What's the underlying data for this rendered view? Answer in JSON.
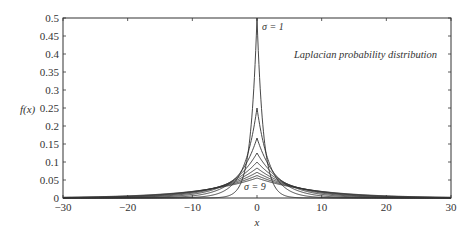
{
  "chart_data": {
    "type": "line",
    "title": "",
    "annotation_title": "Laplacian probability distribution",
    "xlabel": "x",
    "ylabel": "f(x)",
    "xlim": [
      -30,
      30
    ],
    "ylim": [
      0,
      0.5
    ],
    "xticks": [
      -30,
      -20,
      -10,
      0,
      10,
      20,
      30
    ],
    "yticks": [
      0,
      0.05,
      0.1,
      0.15,
      0.2,
      0.25,
      0.3,
      0.35,
      0.4,
      0.45,
      0.5
    ],
    "xtick_labels": [
      "−30",
      "−20",
      "−10",
      "0",
      "10",
      "20",
      "30"
    ],
    "ytick_labels": [
      "0",
      "0.05",
      "0.1",
      "0.15",
      "0.2",
      "0.25",
      "0.3",
      "0.35",
      "0.4",
      "0.45",
      "0.5"
    ],
    "grid": false,
    "legend": "none",
    "formula": "f(x) = (1/(2σ)) exp(-|x|/σ)",
    "series": [
      {
        "name": "σ = 1",
        "sigma": 1,
        "peak": 0.5
      },
      {
        "name": "σ = 2",
        "sigma": 2,
        "peak": 0.25
      },
      {
        "name": "σ = 3",
        "sigma": 3,
        "peak": 0.1667
      },
      {
        "name": "σ = 4",
        "sigma": 4,
        "peak": 0.125
      },
      {
        "name": "σ = 5",
        "sigma": 5,
        "peak": 0.1
      },
      {
        "name": "σ = 6",
        "sigma": 6,
        "peak": 0.0833
      },
      {
        "name": "σ = 7",
        "sigma": 7,
        "peak": 0.0714
      },
      {
        "name": "σ = 8",
        "sigma": 8,
        "peak": 0.0625
      },
      {
        "name": "σ = 9",
        "sigma": 9,
        "peak": 0.0556
      }
    ],
    "annotations": [
      {
        "text": "σ = 1",
        "x": 1.2,
        "y": 0.47
      },
      {
        "text": "σ = 9",
        "x": 0.3,
        "y": 0.012
      }
    ],
    "line_color": "#333333"
  },
  "layout": {
    "plot_left": 63,
    "plot_right": 451,
    "plot_top": 18,
    "plot_bottom": 198
  }
}
